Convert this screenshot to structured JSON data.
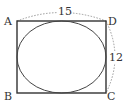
{
  "diagram": {
    "type": "geometry",
    "shapes": {
      "rectangle": {
        "vertices": [
          "A",
          "B",
          "C",
          "D"
        ]
      },
      "ellipse": {
        "inscribed_in": "rectangle ABCD"
      }
    },
    "labels": {
      "A": "A",
      "B": "B",
      "C": "C",
      "D": "D",
      "top_length": "15",
      "right_length": "12"
    },
    "measurements": [
      {
        "segment": "AD",
        "value": "15"
      },
      {
        "segment": "DC",
        "value": "12"
      }
    ],
    "colors": {
      "stroke": "#333333",
      "dotted": "#999999",
      "background": "#ffffff"
    }
  }
}
